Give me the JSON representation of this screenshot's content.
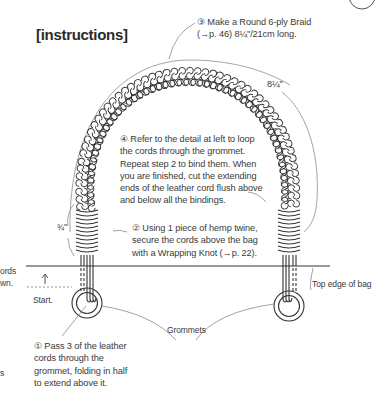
{
  "heading": "[instructions]",
  "steps": {
    "step1": {
      "number": "①",
      "lines": [
        "Pass 3 of the leather",
        "cords through the",
        "grommet, folding in half",
        "to extend above it."
      ]
    },
    "step2": {
      "number": "②",
      "lines": [
        "Using 1 piece of hemp twine,",
        "secure the cords above the bag",
        "with a Wrapping Knot (→p. 22)."
      ]
    },
    "step3": {
      "number": "③",
      "lines": [
        "Make a Round 6-ply Braid",
        "(→p. 46) 8¼\"/21cm long."
      ]
    },
    "step4": {
      "number": "④",
      "lines": [
        "Refer to the detail at left to loop",
        "the cords through the grommet.",
        "Repeat step 2 to bind them. When",
        "you are finished, cut the extending",
        "ends of the leather cord flush above",
        "and below all the bindings."
      ]
    }
  },
  "labels": {
    "braid_length": "8¼\"",
    "binding_length": "¾\"",
    "start": "Start.",
    "grommets": "Grommets",
    "top_edge": "Top edge of bag",
    "clipped_left_1": "ords",
    "clipped_left_2": "wn.",
    "clipped_left_3": "s"
  },
  "colors": {
    "line": "#3a3a3a",
    "leader": "#8a8a8a",
    "text": "#3a3a3a"
  }
}
